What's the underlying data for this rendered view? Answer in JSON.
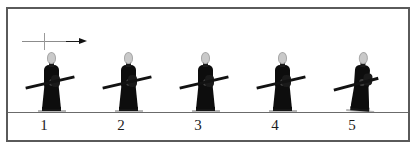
{
  "figure": {
    "caption_numbers": [
      "1",
      "2",
      "3",
      "4",
      "5"
    ],
    "direction_marker": {
      "name": "direction-of-travel-arrow",
      "points": "right"
    },
    "frame": {
      "border_color": "#5a5a5a",
      "background": "#ffffff"
    },
    "ground": {
      "line_color": "#6b6b6b"
    },
    "figures": [
      {
        "index": 1,
        "label": "1",
        "pose": "walking-side-view",
        "robe_color": "#0d0d0d",
        "head_color": "#c9c9c9",
        "carries": "long-pole"
      },
      {
        "index": 2,
        "label": "2",
        "pose": "walking-side-view",
        "robe_color": "#0d0d0d",
        "head_color": "#c9c9c9",
        "carries": "long-pole"
      },
      {
        "index": 3,
        "label": "3",
        "pose": "walking-side-view",
        "robe_color": "#0d0d0d",
        "head_color": "#c9c9c9",
        "carries": "long-pole"
      },
      {
        "index": 4,
        "label": "4",
        "pose": "walking-side-view",
        "robe_color": "#0d0d0d",
        "head_color": "#c9c9c9",
        "carries": "long-pole"
      },
      {
        "index": 5,
        "label": "5",
        "pose": "turning-three-quarter-view",
        "robe_color": "#0d0d0d",
        "head_color": "#c9c9c9",
        "carries": "long-pole"
      }
    ]
  }
}
